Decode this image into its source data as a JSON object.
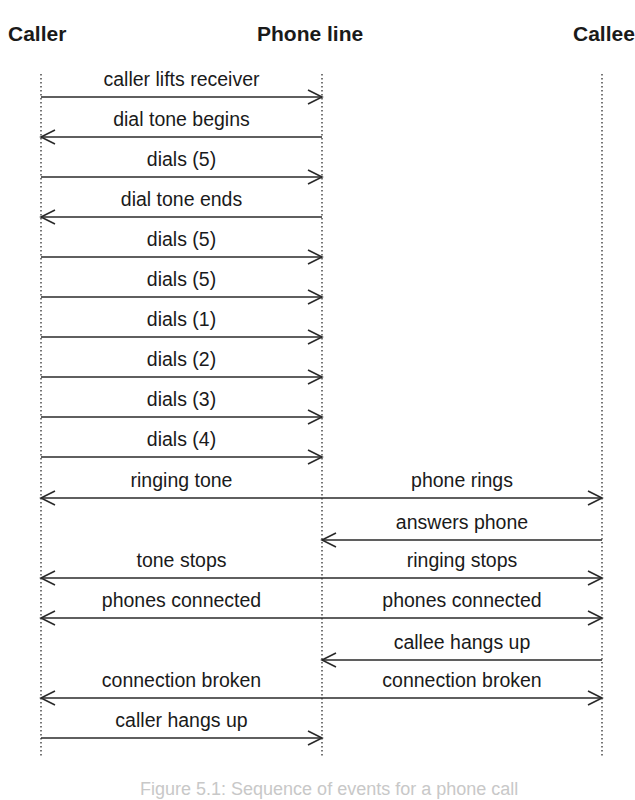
{
  "diagram": {
    "type": "sequence",
    "participants": [
      {
        "id": "caller",
        "label": "Caller",
        "x": 41
      },
      {
        "id": "line",
        "label": "Phone line",
        "x": 322
      },
      {
        "id": "callee",
        "label": "Callee",
        "x": 602
      }
    ],
    "lifeline_top": 74,
    "lifeline_bottom": 756,
    "colors": {
      "line": "#2a2a2a",
      "text": "#1a1a1a",
      "lifeline": "#555555"
    },
    "messages": [
      {
        "y": 97,
        "from": "caller",
        "to": "line",
        "dir": "right",
        "label": "caller lifts receiver"
      },
      {
        "y": 137,
        "from": "line",
        "to": "caller",
        "dir": "left",
        "label": "dial tone begins"
      },
      {
        "y": 177,
        "from": "caller",
        "to": "line",
        "dir": "right",
        "label": "dials (5)"
      },
      {
        "y": 217,
        "from": "line",
        "to": "caller",
        "dir": "left",
        "label": "dial tone ends"
      },
      {
        "y": 257,
        "from": "caller",
        "to": "line",
        "dir": "right",
        "label": "dials (5)"
      },
      {
        "y": 297,
        "from": "caller",
        "to": "line",
        "dir": "right",
        "label": "dials (5)"
      },
      {
        "y": 337,
        "from": "caller",
        "to": "line",
        "dir": "right",
        "label": "dials (1)"
      },
      {
        "y": 377,
        "from": "caller",
        "to": "line",
        "dir": "right",
        "label": "dials (2)"
      },
      {
        "y": 417,
        "from": "caller",
        "to": "line",
        "dir": "right",
        "label": "dials (3)"
      },
      {
        "y": 457,
        "from": "caller",
        "to": "line",
        "dir": "right",
        "label": "dials (4)"
      },
      {
        "y": 498,
        "from": "line",
        "to": "both",
        "dir": "both",
        "label": "ringing tone",
        "label_right": "phone rings"
      },
      {
        "y": 540,
        "from": "callee",
        "to": "line",
        "dir": "left",
        "label": "answers phone",
        "side": "right"
      },
      {
        "y": 578,
        "from": "line",
        "to": "both",
        "dir": "both",
        "label": "tone stops",
        "label_right": "ringing stops"
      },
      {
        "y": 618,
        "from": "line",
        "to": "both",
        "dir": "both",
        "label": "phones connected",
        "label_right": "phones connected"
      },
      {
        "y": 660,
        "from": "callee",
        "to": "line",
        "dir": "left",
        "label": "callee hangs up",
        "side": "right"
      },
      {
        "y": 698,
        "from": "line",
        "to": "both",
        "dir": "both",
        "label": "connection broken",
        "label_right": "connection broken"
      },
      {
        "y": 738,
        "from": "caller",
        "to": "line",
        "dir": "right",
        "label": "caller hangs up"
      }
    ],
    "caption": "Figure 5.1: Sequence of events for a phone call"
  }
}
